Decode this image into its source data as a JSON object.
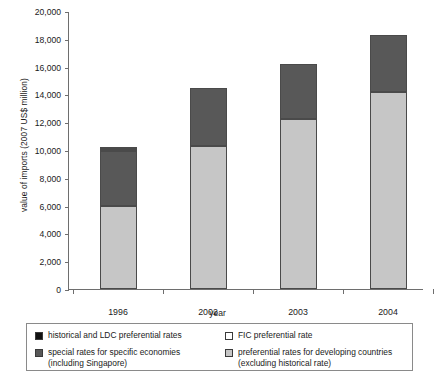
{
  "chart_data": {
    "type": "bar",
    "subtype": "stacked-bar",
    "title": "",
    "xlabel": "year",
    "ylabel": "value of imports (2007 US$ million)",
    "categories": [
      "1996",
      "2002",
      "2003",
      "2004"
    ],
    "ylim": [
      0,
      20000
    ],
    "yticks": [
      "0",
      "2,000",
      "4,000",
      "6,000",
      "8,000",
      "10,000",
      "12,000",
      "14,000",
      "16,000",
      "18,000",
      "20,000"
    ],
    "ytick_values": [
      0,
      2000,
      4000,
      6000,
      8000,
      10000,
      12000,
      14000,
      16000,
      18000,
      20000
    ],
    "grid": false,
    "legend_position": "below-plot",
    "series": [
      {
        "name": "preferential rates for developing countries (excluding historical rate)",
        "color": "#c6c6c6",
        "values": [
          6000,
          10300,
          12200,
          14200
        ]
      },
      {
        "name": "special rates for specific economies (including Singapore)",
        "color": "#585858",
        "values": [
          3950,
          4150,
          4000,
          4050
        ]
      },
      {
        "name": "FIC preferential rate",
        "color": "#ffffff",
        "values": [
          100,
          0,
          0,
          0
        ]
      },
      {
        "name": "historical and LDC preferential rates",
        "color": "#111111",
        "values": [
          60,
          0,
          0,
          0
        ]
      }
    ],
    "totals": [
      10110,
      14450,
      16200,
      18250
    ]
  },
  "legend": {
    "entries": [
      {
        "swatch": "black-swatch",
        "color": "#111111",
        "label": "historical and LDC preferential rates"
      },
      {
        "swatch": "white-swatch",
        "color": "#ffffff",
        "label": "FIC preferential rate"
      },
      {
        "swatch": "dark-gray-swatch",
        "color": "#585858",
        "label": "special rates for specific economies\n(including Singapore)"
      },
      {
        "swatch": "light-gray-swatch",
        "color": "#c6c6c6",
        "label": "preferential rates for developing countries\n(excluding historical rate)"
      }
    ]
  }
}
